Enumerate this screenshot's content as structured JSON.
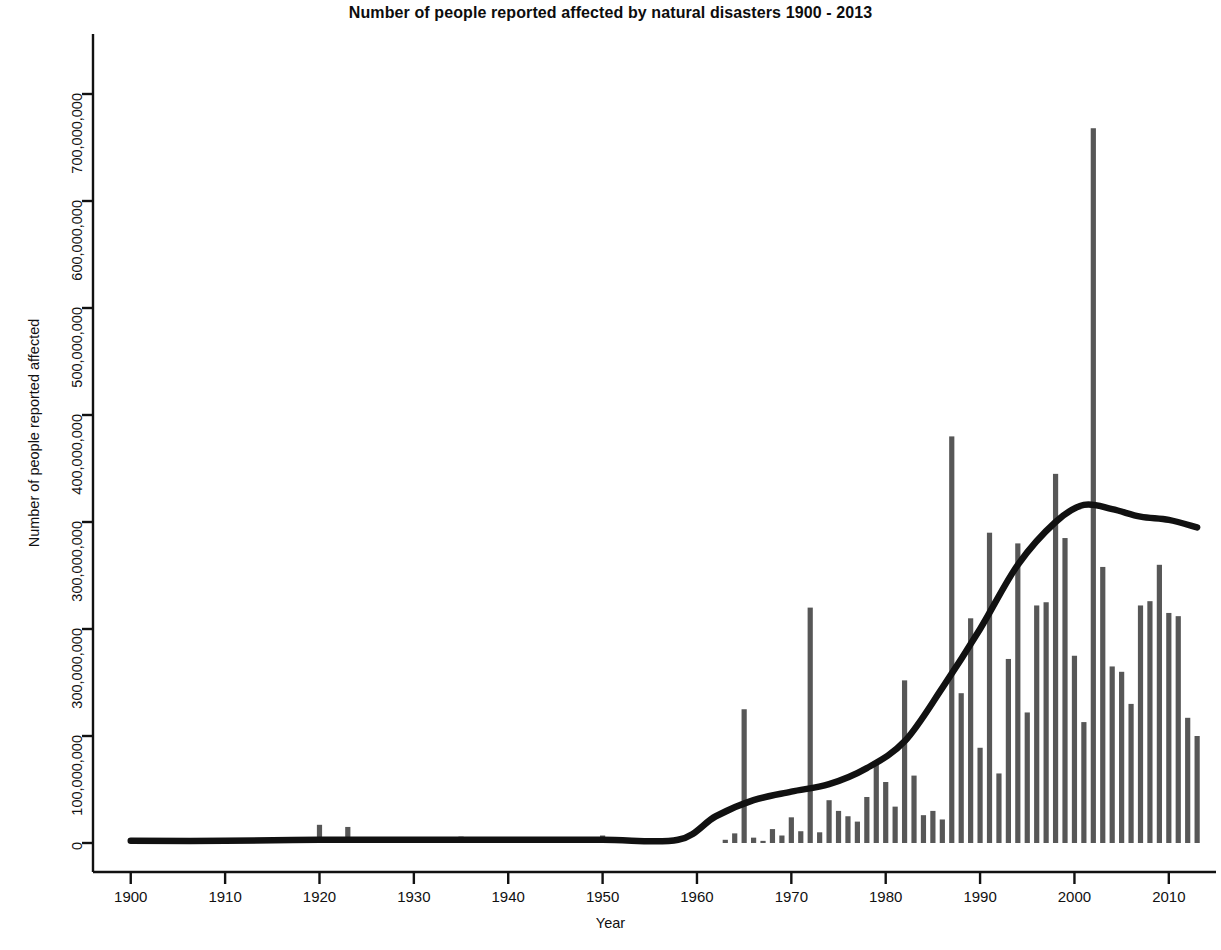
{
  "chart_data": {
    "type": "bar",
    "title": "Number of people reported affected by natural disasters 1900 - 2013",
    "xlabel": "Year",
    "ylabel": "Number of people reported affected",
    "grid": false,
    "legend": null,
    "xlim": [
      1896,
      2015
    ],
    "ylim": [
      0,
      730000000
    ],
    "xticks": [
      1900,
      1910,
      1920,
      1930,
      1940,
      1950,
      1960,
      1970,
      1980,
      1990,
      2000,
      2010
    ],
    "xtick_labels": [
      "1900",
      "1910",
      "1920",
      "1930",
      "1940",
      "1950",
      "1960",
      "1970",
      "1980",
      "1990",
      "2000",
      "2010"
    ],
    "yticks": [
      0,
      100000000,
      200000000,
      300000000,
      400000000,
      500000000,
      600000000,
      700000000
    ],
    "ytick_labels": [
      "0",
      "100,000,000",
      "300,000,000",
      "300,000,000",
      "400,000,000",
      "500,000,000",
      "600,000,000",
      "700,000,000"
    ],
    "bar_color": "#575757",
    "trend_color": "#111111",
    "series": [
      {
        "name": "People reported affected",
        "kind": "bar",
        "x": [
          1900,
          1901,
          1902,
          1903,
          1904,
          1905,
          1906,
          1907,
          1908,
          1909,
          1910,
          1911,
          1912,
          1913,
          1914,
          1915,
          1916,
          1917,
          1918,
          1919,
          1920,
          1921,
          1922,
          1923,
          1924,
          1925,
          1926,
          1927,
          1928,
          1929,
          1930,
          1931,
          1932,
          1933,
          1934,
          1935,
          1936,
          1937,
          1938,
          1939,
          1940,
          1941,
          1942,
          1943,
          1944,
          1945,
          1946,
          1947,
          1948,
          1949,
          1950,
          1951,
          1952,
          1953,
          1954,
          1955,
          1956,
          1957,
          1958,
          1959,
          1960,
          1961,
          1962,
          1963,
          1964,
          1965,
          1966,
          1967,
          1968,
          1969,
          1970,
          1971,
          1972,
          1973,
          1974,
          1975,
          1976,
          1977,
          1978,
          1979,
          1980,
          1981,
          1982,
          1983,
          1984,
          1985,
          1986,
          1987,
          1988,
          1989,
          1990,
          1991,
          1992,
          1993,
          1994,
          1995,
          1996,
          1997,
          1998,
          1999,
          2000,
          2001,
          2002,
          2003,
          2004,
          2005,
          2006,
          2007,
          2008,
          2009,
          2010,
          2011,
          2012,
          2013
        ],
        "values": [
          0,
          0,
          0,
          0,
          0,
          0,
          0,
          0,
          0,
          0,
          0,
          0,
          0,
          0,
          0,
          0,
          0,
          0,
          0,
          0,
          17000000,
          0,
          0,
          15000000,
          0,
          0,
          0,
          0,
          0,
          0,
          0,
          0,
          0,
          0,
          0,
          6000000,
          0,
          0,
          0,
          0,
          0,
          0,
          0,
          0,
          0,
          0,
          0,
          0,
          0,
          0,
          7000000,
          0,
          0,
          0,
          0,
          0,
          0,
          0,
          0,
          0,
          0,
          0,
          0,
          3000000,
          9000000,
          125000000,
          5000000,
          2000000,
          13000000,
          7000000,
          24000000,
          11000000,
          220000000,
          10000000,
          40000000,
          30000000,
          25000000,
          20000000,
          43000000,
          75000000,
          57000000,
          34000000,
          152000000,
          63000000,
          26000000,
          30000000,
          22000000,
          380000000,
          140000000,
          210000000,
          89000000,
          290000000,
          65000000,
          172000000,
          280000000,
          122000000,
          222000000,
          225000000,
          345000000,
          285000000,
          175000000,
          113000000,
          668000000,
          258000000,
          165000000,
          160000000,
          130000000,
          222000000,
          226000000,
          260000000,
          215000000,
          212000000,
          117000000,
          100000000
        ]
      },
      {
        "name": "Smoothed trend",
        "kind": "line",
        "x": [
          1900,
          1910,
          1920,
          1930,
          1940,
          1950,
          1958,
          1962,
          1966,
          1970,
          1974,
          1978,
          1982,
          1986,
          1990,
          1994,
          1998,
          2001,
          2004,
          2007,
          2010,
          2013
        ],
        "values": [
          2000000,
          2000000,
          3000000,
          3000000,
          3000000,
          3000000,
          3000000,
          25000000,
          40000000,
          48000000,
          55000000,
          70000000,
          95000000,
          145000000,
          200000000,
          260000000,
          300000000,
          316000000,
          312000000,
          305000000,
          302000000,
          295000000
        ]
      }
    ],
    "annotations": {
      "peak_year": 2002,
      "peak_value": 668000000
    }
  }
}
